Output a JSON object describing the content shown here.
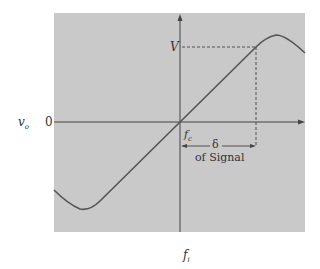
{
  "diagram": {
    "type": "transfer-characteristic",
    "colors": {
      "panel": "#c9c9c9",
      "axis": "#444444",
      "curve": "#555555",
      "dashed": "#444444",
      "text": "#333333"
    },
    "labels": {
      "y_axis": "v",
      "y_axis_sub": "o",
      "zero": "0",
      "v_level": "V",
      "center_freq": "f",
      "center_freq_sub": "c",
      "delta": "δ",
      "delta_caption": "of Signal",
      "x_axis": "f",
      "x_axis_sub": "i"
    }
  }
}
